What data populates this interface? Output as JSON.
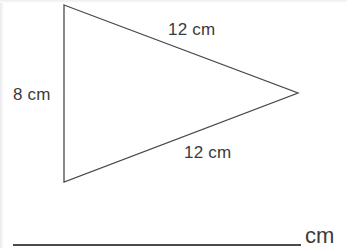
{
  "page": {
    "background_color": "#ffffff",
    "width": 347,
    "height": 248
  },
  "figure": {
    "name": "triangle-diagram",
    "shape": "triangle",
    "stroke_color": "#4a4a4a",
    "fill": "none",
    "stroke_width": 1.3,
    "vertices": {
      "top_left": [
        64,
        5
      ],
      "bottom_left": [
        64,
        182
      ],
      "right_apex": [
        298,
        93
      ]
    },
    "labels": {
      "left_side": "8 cm",
      "top_side": "12 cm",
      "bottom_side": "12 cm"
    }
  },
  "answer": {
    "line_present": true,
    "value": "",
    "unit": "cm"
  }
}
